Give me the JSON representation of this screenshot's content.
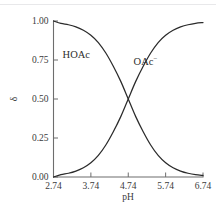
{
  "figure": {
    "background_color": "#ffffff",
    "axis_color": "#6d6d6d",
    "curve_color": "#2b2b2b",
    "top_rule_color": "#e8e8ea"
  },
  "chart_data": {
    "type": "line",
    "title": "",
    "xlabel": "pH",
    "ylabel": "δ",
    "xlim": [
      2.74,
      6.74
    ],
    "ylim": [
      0.0,
      1.0
    ],
    "xticks": [
      2.74,
      3.74,
      4.74,
      5.74,
      6.74
    ],
    "xtick_labels": [
      "2.74",
      "3.74",
      "4.74",
      "5.74",
      "6.74"
    ],
    "yticks": [
      0.0,
      0.25,
      0.5,
      0.75,
      1.0
    ],
    "ytick_labels": [
      "0.00",
      "0.25",
      "0.50",
      "0.75",
      "1.00"
    ],
    "grid": false,
    "legend_position": "inline-annotation",
    "pKa": 4.74,
    "crossing_point": {
      "x": 4.74,
      "y": 0.5
    },
    "series": [
      {
        "name": "HOAc",
        "label": "HOAc",
        "label_x": 3.35,
        "label_y": 0.76,
        "color": "#2b2b2b",
        "x": [
          2.74,
          2.94,
          3.14,
          3.34,
          3.54,
          3.74,
          3.94,
          4.14,
          4.34,
          4.54,
          4.74,
          4.94,
          5.14,
          5.34,
          5.54,
          5.74,
          5.94,
          6.14,
          6.34,
          6.54,
          6.74
        ],
        "values": [
          1.0,
          0.985,
          0.976,
          0.962,
          0.941,
          0.909,
          0.862,
          0.795,
          0.71,
          0.613,
          0.5,
          0.387,
          0.29,
          0.205,
          0.138,
          0.091,
          0.059,
          0.038,
          0.024,
          0.015,
          0.01
        ]
      },
      {
        "name": "OAc-",
        "label": "OAc",
        "label_superscript": "−",
        "label_x": 5.2,
        "label_y": 0.72,
        "color": "#2b2b2b",
        "x": [
          2.74,
          2.94,
          3.14,
          3.34,
          3.54,
          3.74,
          3.94,
          4.14,
          4.34,
          4.54,
          4.74,
          4.94,
          5.14,
          5.34,
          5.54,
          5.74,
          5.94,
          6.14,
          6.34,
          6.54,
          6.74
        ],
        "values": [
          0.0,
          0.015,
          0.024,
          0.038,
          0.059,
          0.091,
          0.138,
          0.205,
          0.29,
          0.387,
          0.5,
          0.613,
          0.71,
          0.795,
          0.862,
          0.909,
          0.941,
          0.962,
          0.976,
          0.985,
          0.99
        ]
      }
    ]
  }
}
